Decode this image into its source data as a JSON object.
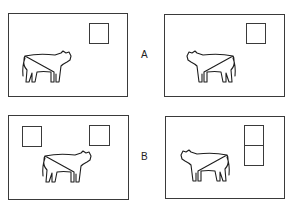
{
  "figure": {
    "rows": [
      {
        "label": "A",
        "panels": [
          {
            "position": "left",
            "cow_facing": "right",
            "squares": [
              "top-right"
            ]
          },
          {
            "position": "right",
            "cow_facing": "left",
            "squares": [
              "top-right"
            ]
          }
        ]
      },
      {
        "label": "B",
        "panels": [
          {
            "position": "left",
            "cow_facing": "right",
            "squares": [
              "top-left",
              "top-right"
            ]
          },
          {
            "position": "right",
            "cow_facing": "left",
            "squares": [
              "top-right-upper",
              "top-right-lower"
            ]
          }
        ]
      }
    ],
    "colors": {
      "line": "#3a3a3a",
      "background": "#ffffff"
    }
  }
}
